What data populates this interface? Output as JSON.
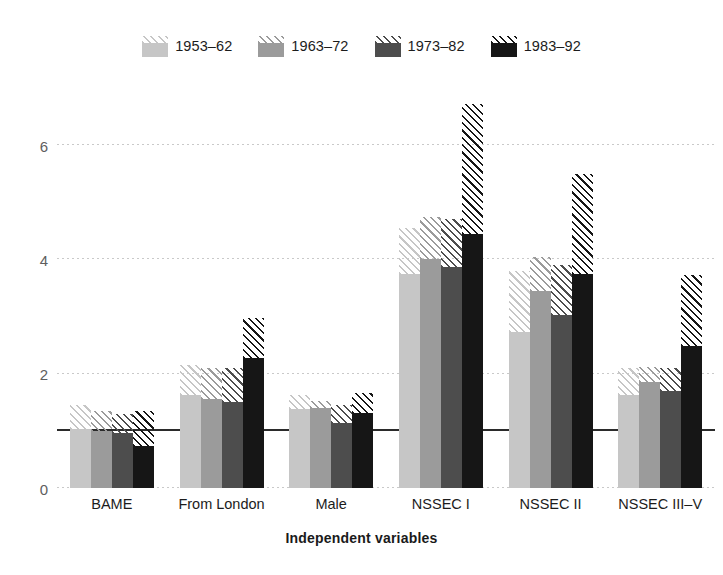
{
  "chart_data": {
    "type": "bar",
    "title": "",
    "xlabel": "Independent variables",
    "ylabel": "",
    "ylim": [
      0,
      7
    ],
    "yticks": [
      0,
      2,
      4,
      6
    ],
    "ytick_labels": [
      "0",
      "2",
      "4",
      "6"
    ],
    "grid": true,
    "legend_position": "top-center",
    "reference_line": {
      "value": 1,
      "label": "",
      "color": "#2b2b2b"
    },
    "bar_style": "solid point estimate with hatched upper confidence interval extension",
    "categories": [
      "BAME",
      "From London",
      "Male",
      "NSSEC I",
      "NSSEC II",
      "NSSEC III–V"
    ],
    "series": [
      {
        "name": "1953–62",
        "color": "#c6c6c6",
        "values": [
          1.03,
          1.62,
          1.38,
          3.75,
          2.73,
          1.63
        ],
        "ci_upper": [
          1.45,
          2.15,
          1.62,
          4.55,
          3.8,
          2.1
        ]
      },
      {
        "name": "1963–72",
        "color": "#9b9b9b",
        "values": [
          1.0,
          1.55,
          1.4,
          4.0,
          3.45,
          1.85
        ],
        "ci_upper": [
          1.35,
          2.1,
          1.52,
          4.75,
          4.05,
          2.12
        ]
      },
      {
        "name": "1973–82",
        "color": "#4d4d4d",
        "values": [
          0.97,
          1.5,
          1.13,
          3.87,
          3.03,
          1.7
        ],
        "ci_upper": [
          1.3,
          2.1,
          1.45,
          4.7,
          3.9,
          2.1
        ]
      },
      {
        "name": "1983–92",
        "color": "#161616",
        "values": [
          0.73,
          2.28,
          1.32,
          4.45,
          3.75,
          2.48
        ],
        "ci_upper": [
          1.35,
          2.98,
          1.67,
          6.72,
          5.5,
          3.72
        ]
      }
    ]
  },
  "legend": {
    "items": [
      {
        "label": "1953–62"
      },
      {
        "label": "1963–72"
      },
      {
        "label": "1973–82"
      },
      {
        "label": "1983–92"
      }
    ]
  },
  "axes": {
    "x_title": "Independent variables"
  }
}
